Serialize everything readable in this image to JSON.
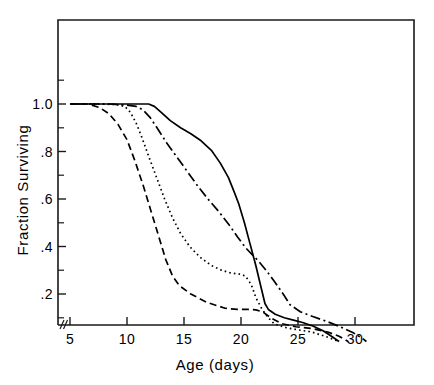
{
  "chart_data": {
    "type": "line",
    "title": "",
    "xlabel": "Age (days)",
    "ylabel": "Fraction Surviving",
    "xlim": [
      4.3,
      35.5
    ],
    "ylim": [
      0.0,
      1.37
    ],
    "grid": false,
    "legend": "none",
    "axis_break": "x-axis break between origin and first tick",
    "xticks": [
      5,
      10,
      15,
      20,
      25,
      30
    ],
    "xtick_labels": [
      "5",
      "10",
      "15",
      "20",
      "25",
      "30"
    ],
    "yticks": [
      0.2,
      0.4,
      0.6,
      0.8,
      1.0
    ],
    "ytick_labels": [
      ".2",
      ".4",
      ".6",
      ".8",
      "1.0"
    ],
    "yticks_minor": [
      0.1,
      0.3,
      0.5,
      0.7,
      0.9,
      1.1
    ],
    "series": [
      {
        "name": "curve-dashed",
        "style": "dashed",
        "dash_pattern": "7,4",
        "x": [
          5.0,
          6.6,
          7.6,
          8.4,
          9.2,
          10.0,
          10.7,
          11.4,
          12.1,
          12.8,
          13.4,
          14.0,
          14.6,
          15.6,
          17.0,
          18.6,
          19.7,
          20.3,
          20.8,
          21.3,
          21.9,
          22.6,
          23.6,
          24.8,
          26.2,
          27.6,
          28.6,
          29.4
        ],
        "y": [
          1.0,
          1.0,
          0.985,
          0.96,
          0.915,
          0.85,
          0.76,
          0.66,
          0.55,
          0.44,
          0.345,
          0.275,
          0.235,
          0.2,
          0.165,
          0.14,
          0.135,
          0.135,
          0.135,
          0.133,
          0.125,
          0.1,
          0.075,
          0.062,
          0.055,
          0.04,
          0.022,
          0.0
        ]
      },
      {
        "name": "curve-dotted",
        "style": "dotted",
        "dash_pattern": "1.6,3.1",
        "x": [
          5.0,
          7.5,
          9.0,
          9.8,
          10.3,
          10.8,
          11.3,
          11.9,
          12.6,
          13.3,
          14.0,
          14.7,
          15.5,
          16.4,
          17.4,
          18.3,
          19.0,
          19.6,
          20.0,
          20.4,
          20.9,
          21.3,
          21.8,
          22.3,
          22.9,
          23.8,
          24.9,
          26.2,
          27.5,
          28.6
        ],
        "y": [
          1.0,
          1.0,
          0.998,
          0.99,
          0.965,
          0.92,
          0.86,
          0.78,
          0.69,
          0.6,
          0.52,
          0.455,
          0.4,
          0.355,
          0.32,
          0.3,
          0.29,
          0.285,
          0.283,
          0.275,
          0.24,
          0.185,
          0.14,
          0.105,
          0.075,
          0.06,
          0.05,
          0.04,
          0.02,
          0.0
        ]
      },
      {
        "name": "curve-dash-dot",
        "style": "dash-dot",
        "dash_pattern": "10,3.5,2,3.5",
        "x": [
          5.0,
          8.5,
          10.0,
          10.8,
          11.4,
          12.0,
          12.7,
          13.5,
          14.4,
          15.3,
          16.2,
          17.1,
          18.0,
          18.9,
          19.7,
          20.4,
          21.0,
          21.6,
          22.2,
          22.9,
          23.7,
          24.3,
          25.2,
          26.3,
          27.5,
          28.7,
          29.8,
          30.6,
          31.0
        ],
        "y": [
          1.0,
          1.0,
          0.995,
          0.99,
          0.975,
          0.945,
          0.895,
          0.835,
          0.775,
          0.715,
          0.655,
          0.6,
          0.55,
          0.495,
          0.44,
          0.395,
          0.365,
          0.335,
          0.3,
          0.255,
          0.2,
          0.155,
          0.125,
          0.105,
          0.085,
          0.062,
          0.038,
          0.015,
          0.0
        ]
      },
      {
        "name": "curve-solid",
        "style": "solid",
        "dash_pattern": "none",
        "x": [
          5.0,
          9.0,
          11.0,
          11.9,
          12.4,
          13.0,
          13.8,
          14.7,
          15.6,
          16.5,
          17.4,
          18.2,
          18.9,
          19.4,
          19.8,
          20.3,
          20.8,
          21.3,
          21.8,
          22.1,
          22.4,
          23.0,
          23.8,
          24.6,
          25.4,
          26.3,
          27.2,
          28.0,
          28.6
        ],
        "y": [
          1.0,
          1.0,
          1.0,
          1.0,
          0.99,
          0.965,
          0.93,
          0.9,
          0.875,
          0.845,
          0.805,
          0.75,
          0.69,
          0.63,
          0.58,
          0.5,
          0.41,
          0.32,
          0.22,
          0.16,
          0.135,
          0.115,
          0.1,
          0.09,
          0.08,
          0.065,
          0.045,
          0.02,
          0.0
        ]
      }
    ]
  }
}
